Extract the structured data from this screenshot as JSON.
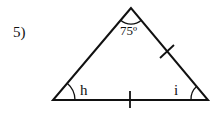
{
  "problem": {
    "number_label": "5)"
  },
  "triangle": {
    "vertices": {
      "apex": [
        131,
        8
      ],
      "bottom_left": [
        53,
        100
      ],
      "bottom_right": [
        208,
        100
      ]
    },
    "angles": {
      "apex_label": "75º",
      "bottom_left_label": "h",
      "bottom_right_label": "i"
    },
    "congruence_ticks": [
      "right-side",
      "base"
    ],
    "stroke_color": "#111111"
  }
}
